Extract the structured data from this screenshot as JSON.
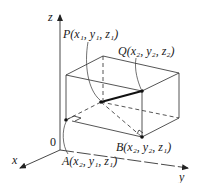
{
  "diagram": {
    "type": "3d-coordinate-box",
    "axes": {
      "x_label": "x",
      "y_label": "y",
      "z_label": "z",
      "origin_label": "0"
    },
    "points": [
      {
        "id": "P",
        "name": "P",
        "coords": [
          "x",
          "1",
          "y",
          "1",
          "z",
          "1"
        ],
        "text": "P(x₁, y₁, z₁)"
      },
      {
        "id": "Q",
        "name": "Q",
        "coords": [
          "x",
          "2",
          "y",
          "2",
          "z",
          "2"
        ],
        "text": "Q(x₂, y₂, z₂)"
      },
      {
        "id": "A",
        "name": "A",
        "coords": [
          "x",
          "2",
          "y",
          "1",
          "z",
          "1"
        ],
        "text": "A(x₂, y₁, z₁)"
      },
      {
        "id": "B",
        "name": "B",
        "coords": [
          "x",
          "2",
          "y",
          "2",
          "z",
          "1"
        ],
        "text": "B(x₂, y₂, z₁)"
      }
    ],
    "segment_highlight": "PQ",
    "colors": {
      "line": "#2a2a2a",
      "background": "#ffffff"
    }
  }
}
